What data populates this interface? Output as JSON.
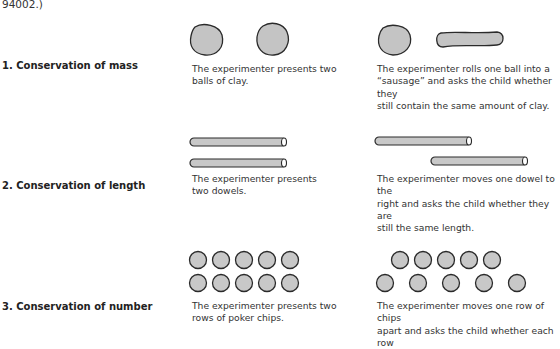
{
  "top_note": "94002.)",
  "rows": [
    {
      "label": "1. Conservation of mass",
      "before_caption_lines": [
        "The experimenter presents two",
        "balls of clay."
      ],
      "after_caption_lines": [
        "The experimenter rolls one ball into a",
        "“sausage” and asks the child whether they",
        "still contain the same amount of clay."
      ]
    },
    {
      "label": "2. Conservation of length",
      "before_caption_lines": [
        "The experimenter presents",
        "two dowels."
      ],
      "after_caption_lines": [
        "The experimenter moves one dowel to the",
        "right and asks the child whether they are",
        "still the same length."
      ]
    },
    {
      "label": "3. Conservation of number",
      "before_caption_lines": [
        "The experimenter presents two",
        "rows of poker chips."
      ],
      "after_caption_lines": [
        "The experimenter moves one row of chips",
        "apart and asks the child whether each row"
      ]
    }
  ],
  "colors": {
    "fill_gray": "#c8c8c8",
    "outline": "#2a2a2a"
  }
}
